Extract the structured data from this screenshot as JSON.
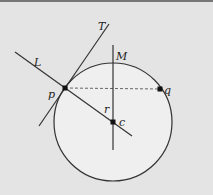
{
  "diagram": {
    "type": "geometry",
    "colors": {
      "background": "#e4e4e4",
      "circle_fill": "#efefef",
      "stroke": "#333333"
    },
    "circle": {
      "cx": 113,
      "cy": 122,
      "r": 59
    },
    "labels": {
      "T": "T",
      "L": "L",
      "M": "M",
      "p": "p",
      "q": "q",
      "r": "r",
      "c": "c"
    },
    "points": [
      {
        "id": "p",
        "x": 65,
        "y": 88
      },
      {
        "id": "q",
        "x": 160,
        "y": 89
      },
      {
        "id": "c",
        "x": 113,
        "y": 122
      }
    ],
    "lines": [
      {
        "id": "L",
        "from": [
          15,
          52
        ],
        "to": [
          132,
          136
        ]
      },
      {
        "id": "T",
        "from": [
          39,
          126
        ],
        "to": [
          109,
          24
        ]
      },
      {
        "id": "M",
        "from": [
          113,
          45
        ],
        "to": [
          113,
          150
        ]
      },
      {
        "id": "pq",
        "from": [
          65,
          88
        ],
        "to": [
          160,
          89
        ],
        "style": "dashed"
      }
    ]
  }
}
